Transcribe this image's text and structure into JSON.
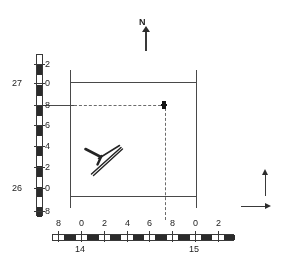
{
  "figure": {
    "type": "survey-site-plan",
    "background_color": "#ffffff",
    "ink_color": "#2d2d2d"
  },
  "north_indicator": {
    "label": "N",
    "direction": "up",
    "icon": "north-arrow-icon"
  },
  "axis_indicators": {
    "vertical": {
      "icon": "arrow-up-icon",
      "direction": "up"
    },
    "horizontal": {
      "icon": "arrow-right-icon",
      "direction": "right"
    }
  },
  "vertical_scale": {
    "orientation": "vertical",
    "name": "northing-scale",
    "ticks": [
      {
        "label": "2",
        "major": "",
        "y": 60
      },
      {
        "label": "0",
        "major": "27",
        "y": 79
      },
      {
        "label": "8",
        "major": "",
        "y": 101
      },
      {
        "label": "6",
        "major": "",
        "y": 121
      },
      {
        "label": "4",
        "major": "",
        "y": 142
      },
      {
        "label": "2",
        "major": "",
        "y": 163
      },
      {
        "label": "0",
        "major": "26",
        "y": 184
      },
      {
        "label": "8",
        "major": "",
        "y": 207
      }
    ],
    "major_labels": [
      "27",
      "26"
    ]
  },
  "horizontal_scale": {
    "orientation": "horizontal",
    "name": "easting-scale",
    "ticks": [
      {
        "label": "8",
        "x": 56
      },
      {
        "label": "0",
        "x": 79
      },
      {
        "label": "2",
        "x": 102
      },
      {
        "label": "4",
        "x": 125
      },
      {
        "label": "6",
        "x": 147
      },
      {
        "label": "8",
        "x": 170
      },
      {
        "label": "0",
        "x": 193
      },
      {
        "label": "2",
        "x": 216
      }
    ],
    "major_labels": [
      {
        "label": "14",
        "x": 75
      },
      {
        "label": "15",
        "x": 189
      }
    ]
  },
  "grid_square": {
    "name": "excavation-grid-square",
    "left_edge": "14.0",
    "right_edge": "15.0",
    "top_edge": "27.0",
    "bottom_edge": "26.0"
  },
  "markers": [
    {
      "name": "find-spot-marker",
      "type": "point",
      "easting": "14.7",
      "northing": "26.8"
    }
  ],
  "feature_symbol": {
    "name": "feature-symbol",
    "type": "hand-drawn-structure",
    "shape": "y-shaped-with-cross-stroke"
  },
  "construction_lines": {
    "horizontal": {
      "value": "26.8",
      "style": "dashed"
    },
    "vertical": {
      "value": "14.7",
      "style": "dashed"
    }
  }
}
